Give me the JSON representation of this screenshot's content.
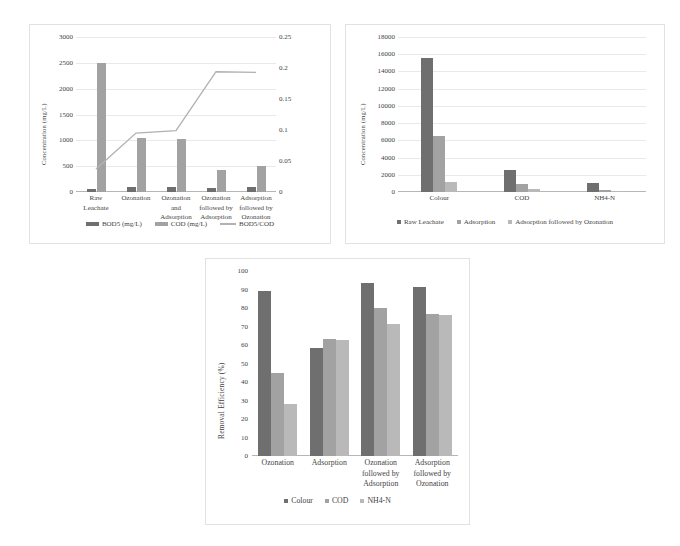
{
  "figure": {
    "background": "#ffffff",
    "panel_border": "#e2e2e2",
    "colors": {
      "series_dark": "#706f6f",
      "series_mid": "#a2a2a2",
      "series_light": "#b9b9b9",
      "line": "#b2b2b2",
      "grid": "#e9e9e9",
      "axis": "#b6b6b6",
      "text": "#3f3f3f"
    }
  },
  "chart_data": [
    {
      "id": "bod-cod-chart",
      "type": "bar",
      "title": "",
      "xlabel": "",
      "ylabel": "Concentration (mg/L)",
      "ylim": [
        0,
        3000
      ],
      "yticks": [
        "0",
        "500",
        "1000",
        "1500",
        "2000",
        "2500",
        "3000"
      ],
      "ytick_values": [
        0,
        500,
        1000,
        1500,
        2000,
        2500,
        3000
      ],
      "y2label": "",
      "y2lim": [
        0,
        0.25
      ],
      "y2ticks": [
        "0",
        "0.05",
        "0.1",
        "0.15",
        "0.2",
        "0.25"
      ],
      "y2tick_values": [
        0,
        0.05,
        0.1,
        0.15,
        0.2,
        0.25
      ],
      "grid": true,
      "legend_position": "bottom",
      "categories": [
        "Raw Leachate",
        "Ozonation",
        "Ozonation and Adsorption",
        "Ozonation followed by Adsorption",
        "Adsorption followed by Ozonation"
      ],
      "series": [
        {
          "name": "BOD5 (mg/L)",
          "kind": "bar",
          "color": "#706f6f",
          "values": [
            55,
            100,
            95,
            70,
            90
          ]
        },
        {
          "name": "COD (mg/L)",
          "kind": "bar",
          "color": "#a2a2a2",
          "values": [
            2500,
            1050,
            1020,
            430,
            500
          ]
        },
        {
          "name": "BOD5/COD",
          "kind": "line",
          "axis": "secondary",
          "color": "#b2b2b2",
          "values": [
            0.037,
            0.095,
            0.099,
            0.194,
            0.193
          ]
        }
      ]
    },
    {
      "id": "concentration-chart",
      "type": "bar",
      "title": "",
      "xlabel": "",
      "ylabel": "Concentration (mg/L)",
      "ylim": [
        0,
        18000
      ],
      "yticks": [
        "0",
        "2000",
        "4000",
        "6000",
        "8000",
        "10000",
        "12000",
        "14000",
        "16000",
        "18000"
      ],
      "ytick_values": [
        0,
        2000,
        4000,
        6000,
        8000,
        10000,
        12000,
        14000,
        16000,
        18000
      ],
      "grid": true,
      "legend_position": "bottom",
      "categories": [
        "Colour",
        "COD",
        "NH4-N"
      ],
      "series": [
        {
          "name": "Raw Leachate",
          "kind": "bar",
          "color": "#706f6f",
          "values": [
            15600,
            2500,
            1000
          ]
        },
        {
          "name": "Adsorption",
          "kind": "bar",
          "color": "#a2a2a2",
          "values": [
            6500,
            900,
            180
          ]
        },
        {
          "name": "Adsorption followed by Ozonation",
          "kind": "bar",
          "color": "#b9b9b9",
          "values": [
            1200,
            400,
            110
          ]
        }
      ]
    },
    {
      "id": "removal-efficiency-chart",
      "type": "bar",
      "title": "",
      "xlabel": "",
      "ylabel": "Removal Efficiency (%)",
      "ylim": [
        0,
        100
      ],
      "yticks": [
        "0",
        "10",
        "20",
        "30",
        "40",
        "50",
        "60",
        "70",
        "80",
        "90",
        "100"
      ],
      "ytick_values": [
        0,
        10,
        20,
        30,
        40,
        50,
        60,
        70,
        80,
        90,
        100
      ],
      "grid": false,
      "legend_position": "bottom",
      "categories": [
        "Ozonation",
        "Adsorption",
        "Ozonation followed by Adsorption",
        "Adsorption followed by Ozonation"
      ],
      "series": [
        {
          "name": "Colour",
          "kind": "bar",
          "color": "#706f6f",
          "values": [
            89,
            58.5,
            93.5,
            91.5
          ]
        },
        {
          "name": "COD",
          "kind": "bar",
          "color": "#a2a2a2",
          "values": [
            45,
            63.5,
            80,
            77
          ]
        },
        {
          "name": "NH4-N",
          "kind": "bar",
          "color": "#b9b9b9",
          "values": [
            28,
            62.5,
            71.5,
            76
          ]
        }
      ]
    }
  ]
}
